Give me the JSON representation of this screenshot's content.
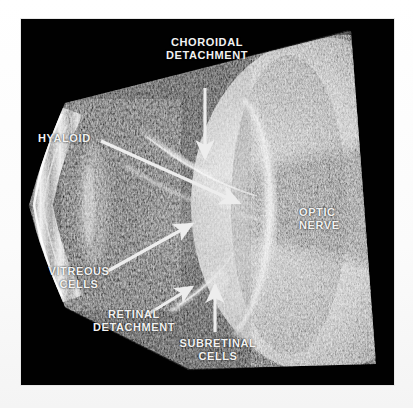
{
  "figure": {
    "kind": "ocular-b-scan-ultrasound",
    "modality_label": "B-scan ultrasonography",
    "plate_background": "#010101",
    "page_background": "#ffffff",
    "annotation_color": "#f2f2f2",
    "arrow_color": "#ededed"
  },
  "annotations": [
    {
      "id": "choroidal-detachment",
      "text": "CHOROIDAL\nDETACHMENT",
      "align": "center",
      "label_x": 148,
      "label_y": 36,
      "label_w": 118,
      "arrow": {
        "x1": 205,
        "y1": 88,
        "x2": 205,
        "y2": 158,
        "head": "end"
      }
    },
    {
      "id": "hyaloid",
      "text": "HYALOID",
      "align": "left",
      "label_x": 38,
      "label_y": 132,
      "label_w": 70,
      "arrow": {
        "x1": 101,
        "y1": 141,
        "x2": 239,
        "y2": 203,
        "head": "end"
      }
    },
    {
      "id": "vitreous-cells",
      "text": "VITREOUS\nCELLS",
      "align": "center",
      "label_x": 36,
      "label_y": 265,
      "label_w": 86,
      "arrow": {
        "x1": 106,
        "y1": 272,
        "x2": 192,
        "y2": 224,
        "head": "end"
      }
    },
    {
      "id": "retinal-detachment",
      "text": "RETINAL\nDETACHMENT",
      "align": "center",
      "label_x": 78,
      "label_y": 308,
      "label_w": 112,
      "arrow": {
        "x1": 145,
        "y1": 316,
        "x2": 192,
        "y2": 287,
        "head": "end"
      }
    },
    {
      "id": "subretinal-cells",
      "text": "SUBRETINAL\nCELLS",
      "align": "center",
      "label_x": 163,
      "label_y": 337,
      "label_w": 110,
      "arrow": {
        "x1": 215,
        "y1": 332,
        "x2": 215,
        "y2": 285,
        "head": "end"
      }
    },
    {
      "id": "optic-nerve",
      "text": "OPTIC\nNERVE",
      "align": "left",
      "label_x": 299,
      "label_y": 206,
      "label_w": 70,
      "arrow": null
    }
  ]
}
